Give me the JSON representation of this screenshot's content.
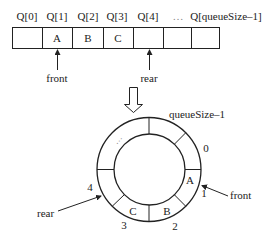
{
  "linear_queue": {
    "index_labels": [
      "Q[0]",
      "Q[1]",
      "Q[2]",
      "Q[3]",
      "Q[4]",
      "…",
      "Q[queueSize–1]"
    ],
    "cells": [
      "",
      "A",
      "B",
      "C",
      "",
      "",
      ""
    ],
    "front_label": "front",
    "rear_label": "rear"
  },
  "circular_queue": {
    "top_label": "queueSize–1",
    "position_labels": [
      "0",
      "1",
      "2",
      "3",
      "4"
    ],
    "cells": [
      "A",
      "B",
      "C"
    ],
    "ellipsis": "…",
    "front_label": "front",
    "rear_label": "rear"
  },
  "colors": {
    "stroke": "#222222",
    "background": "#ffffff"
  }
}
